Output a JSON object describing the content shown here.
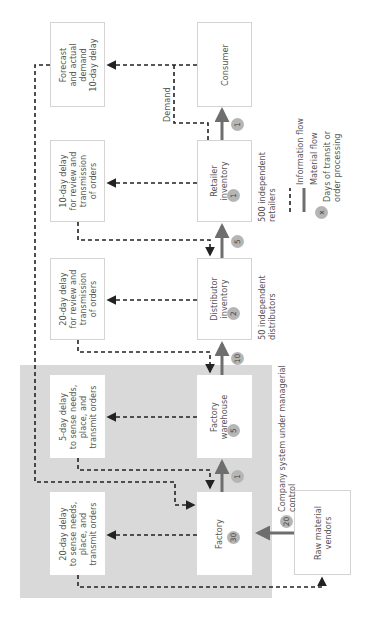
{
  "region": {
    "label": "Company system under managerial\ncontrol",
    "color": "#d9d9d9"
  },
  "boxes": {
    "consumer": {
      "label": "Consumer"
    },
    "retailer": {
      "label": "Retailer\ninventory",
      "days": "1",
      "note": "500 independent\nretailers"
    },
    "distributor": {
      "label": "Distributor\ninventory",
      "days": "2",
      "note": "50 independent\ndistributors"
    },
    "warehouse": {
      "label": "Factory\nwarehouse",
      "days": "5"
    },
    "factory": {
      "label": "Factory",
      "days": "30"
    },
    "vendors": {
      "label": "Raw material\nvendors"
    }
  },
  "delays": {
    "forecast": "Forecast\nand actual\ndemand\n10-day delay",
    "retailer": "10-day delay\nfor review and\ntransmission\nof orders",
    "distributor": "20-day delay\nfor review and\ntransmission\nof orders",
    "warehouse": "5-day delay\nto sense needs,\nplace, and\ntransmit orders",
    "factory": "20-day delay\nto sense needs,\nplace, and\ntransmit orders"
  },
  "transit": {
    "retailer_to_consumer": "1",
    "distributor_to_retailer": "5",
    "warehouse_to_distributor": "10",
    "factory_to_warehouse": "1",
    "vendors_to_factory": "20"
  },
  "demand_label": "Demand",
  "legend": {
    "info": "Information flow",
    "material": "Material flow",
    "days_symbol": "x",
    "days": "Days of transit or\norder processing"
  },
  "colors": {
    "material": "#6e6e6e",
    "info": "#222222",
    "badge": "#b5b5b5",
    "border": "#d4d4d4"
  }
}
